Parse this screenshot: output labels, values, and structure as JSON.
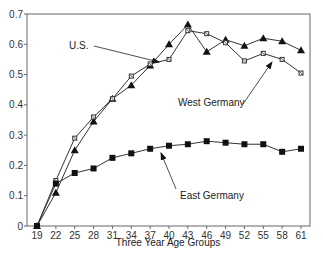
{
  "chart_data": {
    "type": "line",
    "title": "",
    "xlabel": "Three Year Age Groups",
    "ylabel": "",
    "ylim": [
      0,
      0.7
    ],
    "yticks": [
      0,
      0.1,
      0.2,
      0.3,
      0.4,
      0.5,
      0.6,
      0.7
    ],
    "ytick_labels": [
      "0",
      "0.1",
      "0.2",
      "0.3",
      "0.4",
      "0.5",
      "0.6",
      "0.7"
    ],
    "categories": [
      "19",
      "22",
      "25",
      "28",
      "31",
      "34",
      "37",
      "40",
      "43",
      "46",
      "49",
      "52",
      "55",
      "58",
      "61"
    ],
    "grid": false,
    "legend": "none (inline annotations with arrows)",
    "series": [
      {
        "name": "U.S.",
        "marker": "triangle",
        "values": [
          0,
          0.11,
          0.25,
          0.345,
          0.42,
          0.465,
          0.53,
          0.6,
          0.665,
          0.575,
          0.615,
          0.595,
          0.62,
          0.61,
          0.58
        ]
      },
      {
        "name": "West Germany",
        "marker": "x-square",
        "values": [
          0,
          0.15,
          0.29,
          0.36,
          0.42,
          0.495,
          0.535,
          0.55,
          0.645,
          0.635,
          0.605,
          0.545,
          0.57,
          0.55,
          0.505
        ]
      },
      {
        "name": "East Germany",
        "marker": "square",
        "values": [
          0,
          0.14,
          0.175,
          0.19,
          0.225,
          0.24,
          0.255,
          0.265,
          0.27,
          0.28,
          0.275,
          0.27,
          0.27,
          0.245,
          0.255
        ]
      }
    ],
    "annotations": [
      {
        "text": "U.S.",
        "x": 69,
        "y": 49,
        "arrow_to": [
          159,
          62
        ]
      },
      {
        "text": "West Germany",
        "x": 178,
        "y": 106,
        "arrow_to": [
          272,
          62
        ]
      },
      {
        "text": "East Germany",
        "x": 180,
        "y": 199,
        "arrow_to": [
          161,
          153
        ]
      }
    ]
  }
}
